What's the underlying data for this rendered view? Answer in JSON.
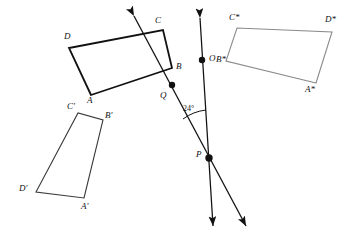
{
  "figure": {
    "type": "geometry-diagram",
    "width": 357,
    "height": 243,
    "background": "#ffffff",
    "stroke_dark": "#111111",
    "stroke_mid": "#3a3a3a",
    "stroke_light": "#8a8a8a"
  },
  "shapes": [
    {
      "id": "abcd",
      "name": "quadrilateral-abcd",
      "stroke": "#111111",
      "stroke_width": 1.7,
      "points": "91,95 69,48 163,30 172,68",
      "vertices": [
        {
          "label": "A",
          "x": 91,
          "y": 95,
          "lx": 88,
          "ly": 97
        },
        {
          "label": "B",
          "x": 172,
          "y": 68,
          "lx": 176,
          "ly": 63
        },
        {
          "label": "C",
          "x": 163,
          "y": 30,
          "lx": 155,
          "ly": 17
        },
        {
          "label": "D",
          "x": 69,
          "y": 48,
          "lx": 64,
          "ly": 33
        }
      ]
    },
    {
      "id": "abcd-prime",
      "name": "quadrilateral-a-prime-b-prime-c-prime-d-prime",
      "stroke": "#3a3a3a",
      "stroke_width": 1.1,
      "points": "84,198 103,120 78,113 36,192",
      "vertices": [
        {
          "label": "A'",
          "x": 84,
          "y": 198,
          "lx": 82,
          "ly": 203
        },
        {
          "label": "B'",
          "x": 103,
          "y": 120,
          "lx": 106,
          "ly": 112
        },
        {
          "label": "C'",
          "x": 78,
          "y": 113,
          "lx": 68,
          "ly": 103
        },
        {
          "label": "D'",
          "x": 36,
          "y": 192,
          "lx": 20,
          "ly": 185
        }
      ]
    },
    {
      "id": "abcd-star",
      "name": "quadrilateral-a-star-b-star-c-star-d-star",
      "stroke": "#8a8a8a",
      "stroke_width": 1.1,
      "points": "316,83 226,61 237,28 332,32",
      "vertices": [
        {
          "label": "A*",
          "x": 316,
          "y": 83,
          "lx": 306,
          "ly": 86
        },
        {
          "label": "B*",
          "x": 226,
          "y": 61,
          "lx": 218,
          "ly": 57
        },
        {
          "label": "C*",
          "x": 237,
          "y": 28,
          "lx": 230,
          "ly": 14
        },
        {
          "label": "D*",
          "x": 332,
          "y": 32,
          "lx": 326,
          "ly": 17
        }
      ]
    }
  ],
  "lines": [
    {
      "id": "line-op",
      "name": "line-through-o-and-p",
      "stroke": "#111111",
      "stroke_width": 1.3,
      "x1": 200,
      "y1": 18,
      "x2": 213,
      "y2": 226,
      "arrow_start": true,
      "arrow_end": true
    },
    {
      "id": "line-qp",
      "name": "line-through-q-and-p",
      "stroke": "#111111",
      "stroke_width": 1.3,
      "x1": 134,
      "y1": 16,
      "x2": 246,
      "y2": 226,
      "arrow_start": true,
      "arrow_end": true
    }
  ],
  "points": [
    {
      "label": "O",
      "name": "point-o",
      "x": 202,
      "y": 60,
      "lx": 209,
      "ly": 55,
      "r": 3.2
    },
    {
      "label": "Q",
      "name": "point-q",
      "x": 172,
      "y": 85,
      "lx": 161,
      "ly": 92,
      "r": 3.2
    },
    {
      "label": "P",
      "name": "point-p",
      "x": 209,
      "y": 158,
      "lx": 197,
      "ly": 151,
      "r": 3.6
    }
  ],
  "angle": {
    "name": "angle-24-degrees",
    "label": "24°",
    "value": 24,
    "unit": "degrees",
    "label_x": 184,
    "label_y": 107,
    "arc": {
      "cx": 209,
      "cy": 158,
      "radius": 47,
      "path": "M 184 120 A 47 47 0 0 1 205 112"
    }
  }
}
